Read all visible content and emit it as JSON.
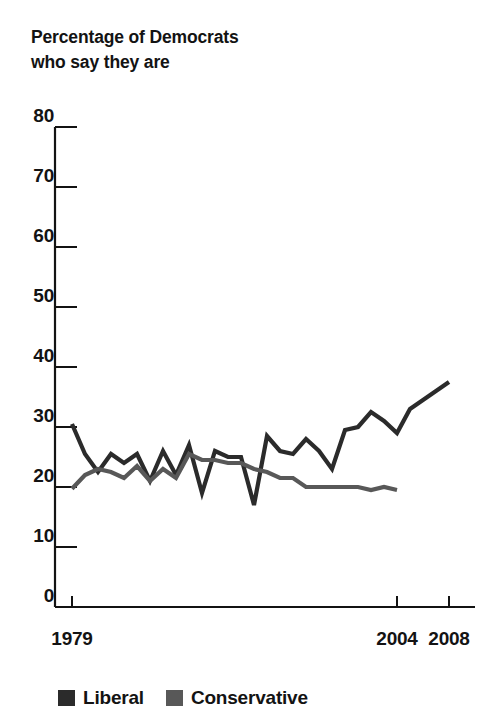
{
  "chart_data": {
    "type": "line",
    "title": "Percentage of Democrats\nwho say they are",
    "xlabel": "",
    "ylabel": "",
    "ylim": [
      0,
      80
    ],
    "ytick_labels": [
      "0",
      "10",
      "20",
      "30",
      "40",
      "50",
      "60",
      "70",
      "80"
    ],
    "ytick_values": [
      0,
      10,
      20,
      30,
      40,
      50,
      60,
      70,
      80
    ],
    "xlim": [
      1979,
      2008
    ],
    "xtick_labels": [
      "1979",
      "2004",
      "2008"
    ],
    "xtick_values": [
      1979,
      2004,
      2008
    ],
    "grid": false,
    "legend_position": "bottom-left",
    "series": [
      {
        "name": "Liberal",
        "color": "#2b2b2b",
        "x": [
          1979,
          1980,
          1981,
          1982,
          1983,
          1984,
          1985,
          1986,
          1987,
          1988,
          1989,
          1990,
          1991,
          1992,
          1993,
          1994,
          1995,
          1996,
          1997,
          1998,
          1999,
          2000,
          2001,
          2002,
          2003,
          2004,
          2005,
          2006,
          2007,
          2008
        ],
        "values": [
          30.5,
          25.5,
          22.5,
          25.5,
          24.0,
          25.5,
          21.0,
          26.0,
          22.0,
          27.0,
          19.0,
          26.0,
          25.0,
          25.0,
          17.0,
          28.5,
          26.0,
          25.5,
          28.0,
          26.0,
          23.0,
          29.5,
          30.0,
          32.5,
          31.0,
          29.0,
          33.0,
          34.5,
          36.0,
          37.5
        ]
      },
      {
        "name": "Conservative",
        "color": "#585858",
        "x": [
          1979,
          1980,
          1981,
          1982,
          1983,
          1984,
          1985,
          1986,
          1987,
          1988,
          1989,
          1990,
          1991,
          1992,
          1993,
          1994,
          1995,
          1996,
          1997,
          1998,
          1999,
          2000,
          2001,
          2002,
          2003,
          2004
        ],
        "values": [
          19.7,
          22.0,
          23.0,
          22.5,
          21.5,
          23.5,
          21.0,
          23.0,
          21.5,
          25.5,
          24.5,
          24.5,
          24.0,
          24.0,
          23.0,
          22.5,
          21.5,
          21.5,
          20.0,
          20.0,
          20.0,
          20.0,
          20.0,
          19.5,
          20.0,
          19.5
        ]
      }
    ]
  },
  "legend": {
    "items": [
      {
        "label": "Liberal",
        "color": "#2b2b2b",
        "swatch_name": "legend-swatch-liberal"
      },
      {
        "label": "Conservative",
        "color": "#585858",
        "swatch_name": "legend-swatch-conservative"
      }
    ]
  },
  "axis": {
    "line_color": "#131313"
  }
}
